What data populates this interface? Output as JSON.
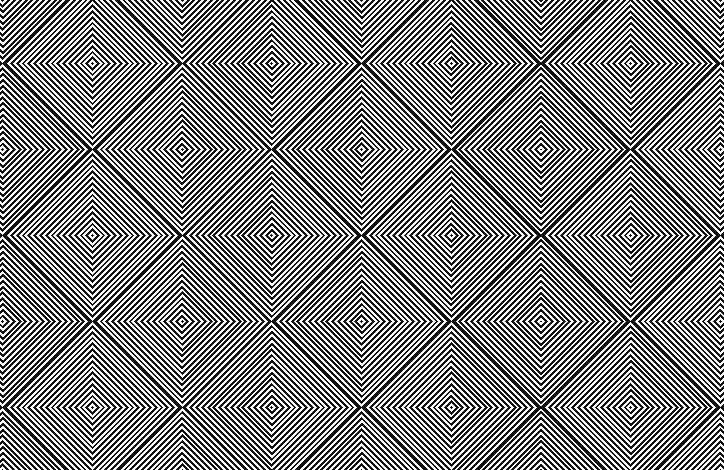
{
  "image": {
    "title": "Op-art concentric diamond pattern",
    "description": "Black and white optical illusion of nested diamonds arranged in an offset lattice",
    "colors": {
      "ink": "#111111",
      "paper": "#ffffff"
    },
    "pattern": {
      "origin_x": 92,
      "origin_y": 63,
      "step_x": 89.7,
      "step_y": 86,
      "stripe_period": 5.8
    }
  }
}
